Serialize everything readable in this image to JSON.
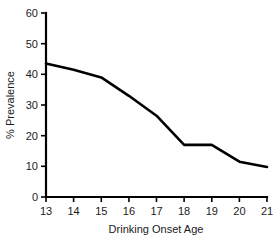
{
  "chart_data": {
    "type": "line",
    "title": "",
    "xlabel": "Drinking Onset Age",
    "ylabel": "% Prevalence",
    "x": [
      13,
      14,
      15,
      16,
      17,
      18,
      19,
      20,
      21
    ],
    "values": [
      43.5,
      41.5,
      39,
      33,
      26.5,
      17,
      17,
      11.5,
      9.8
    ],
    "series": [
      {
        "name": "% Prevalence",
        "values": [
          43.5,
          41.5,
          39,
          33,
          26.5,
          17,
          17,
          11.5,
          9.8
        ]
      }
    ],
    "xlim": [
      13,
      21
    ],
    "ylim": [
      0,
      60
    ],
    "xticks": [
      "13",
      "14",
      "15",
      "16",
      "17",
      "18",
      "19",
      "20",
      "21"
    ],
    "yticks": [
      "0",
      "10",
      "20",
      "30",
      "40",
      "50",
      "60"
    ],
    "grid": false,
    "legend": false,
    "legend_position": "none",
    "line_color": "#000000",
    "background_color": "#ffffff"
  },
  "axes": {
    "x_title": "Drinking Onset Age",
    "y_title": "% Prevalence",
    "x_tick_labels": [
      "13",
      "14",
      "15",
      "16",
      "17",
      "18",
      "19",
      "20",
      "21"
    ],
    "y_tick_labels": [
      "0",
      "10",
      "20",
      "30",
      "40",
      "50",
      "60"
    ]
  }
}
